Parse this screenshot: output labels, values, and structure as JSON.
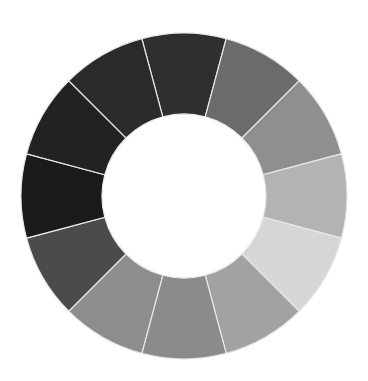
{
  "wheel": {
    "center": [
      184,
      196
    ],
    "outer_radius": 163,
    "inner_radius": 82,
    "start_angle_deg": -15,
    "separator_color": "#e8e8e8",
    "segments": [
      {
        "color": "#2f2f2f"
      },
      {
        "color": "#6b6b6b"
      },
      {
        "color": "#8f8f8f"
      },
      {
        "color": "#b3b3b3"
      },
      {
        "color": "#d6d6d6"
      },
      {
        "color": "#a2a2a2"
      },
      {
        "color": "#8b8b8b"
      },
      {
        "color": "#8d8d8d"
      },
      {
        "color": "#4b4b4b"
      },
      {
        "color": "#1a1a1a"
      },
      {
        "color": "#222222"
      },
      {
        "color": "#2a2a2a"
      }
    ]
  }
}
